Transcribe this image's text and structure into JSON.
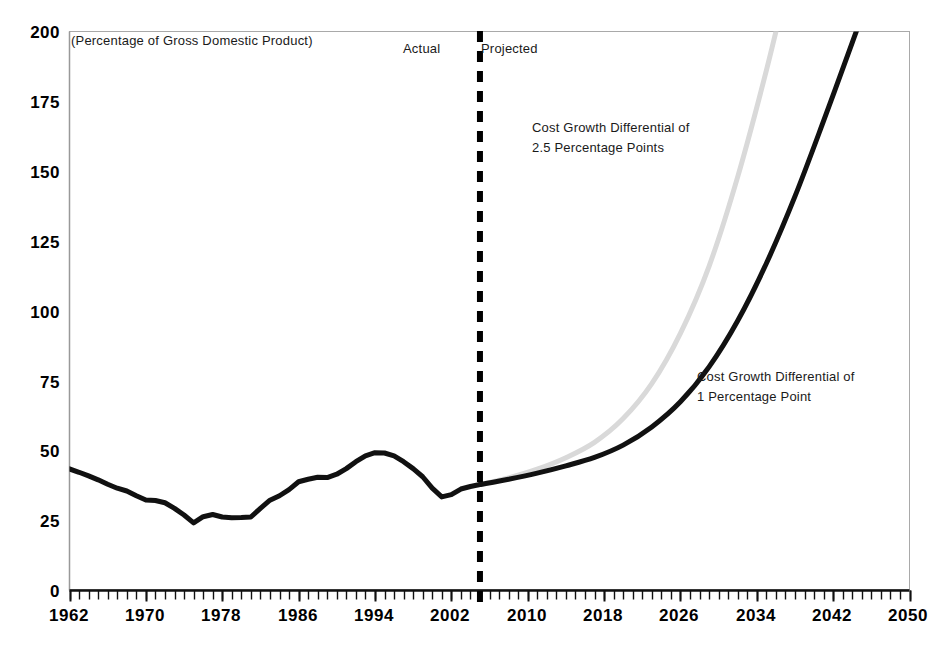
{
  "chart_data": {
    "type": "line",
    "title": "",
    "subtitle": "(Percentage of Gross Domestic Product)",
    "xlabel": "",
    "ylabel": "",
    "xlim": [
      1962,
      2050
    ],
    "ylim": [
      0,
      200
    ],
    "grid": false,
    "legend_position": "inline-annotations",
    "x_ticks": [
      1962,
      1970,
      1978,
      1986,
      1994,
      2002,
      2010,
      2018,
      2026,
      2034,
      2042,
      2050
    ],
    "x_tick_labels": [
      "1962",
      "1970",
      "1978",
      "1986",
      "1994",
      "2002",
      "2010",
      "2018",
      "2026",
      "2034",
      "2042",
      "2050"
    ],
    "x_minor_tick_interval": 1,
    "y_ticks": [
      0,
      25,
      50,
      75,
      100,
      125,
      150,
      175,
      200
    ],
    "y_tick_labels": [
      "0",
      "25",
      "50",
      "75",
      "100",
      "125",
      "150",
      "175",
      "200"
    ],
    "divider": {
      "year": 2005,
      "style": "dashed",
      "color": "#000000",
      "left_label": "Actual",
      "right_label": "Projected"
    },
    "annotations": [
      {
        "id": "annot-25",
        "line1": "Cost Growth Differential of",
        "line2": "2.5 Percentage Points",
        "series": "Cost Growth Differential of 2.5 Percentage Points"
      },
      {
        "id": "annot-1",
        "line1": "Cost Growth Differential of",
        "line2": "1 Percentage Point",
        "series": "Cost Growth Differential of 1 Percentage Point"
      }
    ],
    "series": [
      {
        "name": "Actual",
        "color": "#111111",
        "width": 5,
        "x": [
          1962,
          1963,
          1964,
          1965,
          1966,
          1967,
          1968,
          1969,
          1970,
          1971,
          1972,
          1973,
          1974,
          1975,
          1976,
          1977,
          1978,
          1979,
          1980,
          1981,
          1982,
          1983,
          1984,
          1985,
          1986,
          1987,
          1988,
          1989,
          1990,
          1991,
          1992,
          1993,
          1994,
          1995,
          1996,
          1997,
          1998,
          1999,
          2000,
          2001,
          2002,
          2003,
          2004,
          2005
        ],
        "values": [
          43.5,
          42.3,
          41.0,
          39.6,
          38.0,
          36.6,
          35.6,
          33.9,
          32.4,
          32.2,
          31.4,
          29.4,
          27.0,
          24.2,
          26.4,
          27.2,
          26.3,
          26.0,
          26.1,
          26.3,
          29.4,
          32.3,
          33.9,
          36.1,
          38.9,
          39.8,
          40.5,
          40.4,
          41.6,
          43.6,
          46.1,
          48.2,
          49.3,
          49.2,
          48.2,
          46.1,
          43.6,
          40.7,
          36.6,
          33.5,
          34.3,
          36.3,
          37.2,
          37.9
        ]
      },
      {
        "name": "Cost Growth Differential of 1 Percentage Point",
        "color": "#111111",
        "width": 5,
        "x": [
          2005,
          2008,
          2011,
          2014,
          2017,
          2020,
          2023,
          2026,
          2029,
          2032,
          2035,
          2038,
          2041,
          2044,
          2046
        ],
        "values": [
          37.9,
          39.8,
          42.0,
          44.6,
          47.6,
          52.0,
          58.5,
          67.5,
          80.0,
          96.5,
          117.0,
          141.0,
          168.0,
          196.0,
          215.0
        ]
      },
      {
        "name": "Cost Growth Differential of 2.5 Percentage Points",
        "color": "#d9d9d9",
        "width": 5,
        "x": [
          2005,
          2008,
          2011,
          2014,
          2017,
          2020,
          2023,
          2026,
          2029,
          2032,
          2035,
          2038,
          2040
        ],
        "values": [
          37.9,
          40.3,
          43.4,
          47.5,
          53.0,
          61.5,
          74.0,
          92.0,
          116.0,
          148.0,
          186.0,
          228.0,
          252.0
        ]
      }
    ]
  },
  "axis": {
    "y_label_values": [
      "200",
      "175",
      "150",
      "125",
      "100",
      "75",
      "50",
      "25",
      "0"
    ],
    "x_label_values": [
      "1962",
      "1970",
      "1978",
      "1986",
      "1994",
      "2002",
      "2010",
      "2018",
      "2026",
      "2034",
      "2042",
      "2050"
    ]
  },
  "labels": {
    "subtitle": "(Percentage of Gross Domestic Product)",
    "actual": "Actual",
    "projected": "Projected",
    "annot_25_line1": "Cost Growth Differential of",
    "annot_25_line2": "2.5 Percentage Points",
    "annot_1_line1": "Cost Growth Differential of",
    "annot_1_line2": "1 Percentage Point"
  },
  "colors": {
    "actual_line": "#111111",
    "projection_1pt": "#111111",
    "projection_25pt": "#d9d9d9",
    "frame": "#aaaaaa",
    "divider": "#000000"
  }
}
